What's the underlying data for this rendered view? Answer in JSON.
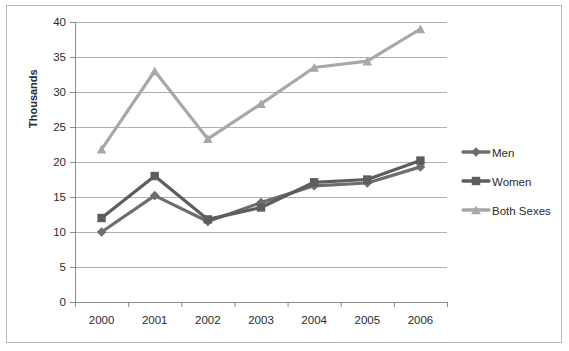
{
  "chart_data": {
    "type": "line",
    "title": "",
    "xlabel": "",
    "ylabel": "Thousands",
    "categories": [
      "2000",
      "2001",
      "2002",
      "2003",
      "2004",
      "2005",
      "2006"
    ],
    "x_tick_labels": [
      "2000",
      "2001",
      "2002",
      "2003",
      "2004",
      "2005",
      "2006"
    ],
    "y_tick_labels": [
      "0",
      "5",
      "10",
      "15",
      "20",
      "25",
      "30",
      "35",
      "40"
    ],
    "y_ticks": [
      0,
      5,
      10,
      15,
      20,
      25,
      30,
      35,
      40
    ],
    "ylim": [
      0,
      40
    ],
    "grid": "horizontal",
    "legend_position": "right",
    "series": [
      {
        "name": "Men",
        "marker": "diamond",
        "color": "#6e6e6e",
        "values": [
          10.0,
          15.2,
          11.5,
          14.2,
          16.6,
          17.0,
          19.3
        ]
      },
      {
        "name": "Women",
        "marker": "square",
        "color": "#5d5d5d",
        "values": [
          12.0,
          18.0,
          11.8,
          13.5,
          17.1,
          17.5,
          20.2
        ]
      },
      {
        "name": "Both Sexes",
        "marker": "triangle",
        "color": "#a8a8a8",
        "values": [
          21.8,
          33.0,
          23.3,
          28.3,
          33.5,
          34.4,
          39.0
        ]
      }
    ]
  },
  "axis": {
    "y_title": "Thousands"
  },
  "legend": {
    "items": [
      {
        "label": "Men"
      },
      {
        "label": "Women"
      },
      {
        "label": "Both Sexes"
      }
    ]
  },
  "colors": {
    "men": "#6e6e6e",
    "women": "#5d5d5d",
    "both_sexes": "#a8a8a8",
    "gridline": "#9a9a9a",
    "axis": "#8a8a8a",
    "text": "#2b2b2b",
    "background": "#ffffff",
    "outer_border": "#b9b9b9"
  }
}
